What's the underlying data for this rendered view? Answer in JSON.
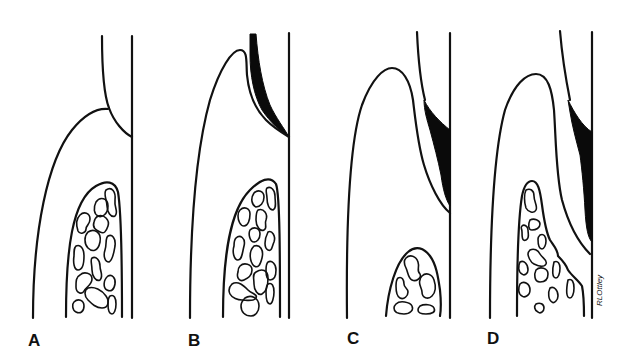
{
  "figure": {
    "type": "dental periodontal cross-section diagram series",
    "colors": {
      "line": "#111111",
      "calculus": "#0a0a0a",
      "background": "#ffffff"
    },
    "panels": [
      {
        "id": "A",
        "label": "A",
        "features": [
          "tooth",
          "enamel",
          "gingiva",
          "alveolar-bone"
        ]
      },
      {
        "id": "B",
        "label": "B",
        "features": [
          "tooth",
          "gingiva",
          "calculus",
          "alveolar-bone"
        ]
      },
      {
        "id": "C",
        "label": "C",
        "features": [
          "tooth",
          "enamel",
          "gingiva",
          "calculus",
          "alveolar-bone"
        ]
      },
      {
        "id": "D",
        "label": "D",
        "features": [
          "tooth",
          "enamel",
          "gingiva",
          "calculus",
          "alveolar-bone"
        ]
      }
    ],
    "signature": "RLOttley"
  }
}
